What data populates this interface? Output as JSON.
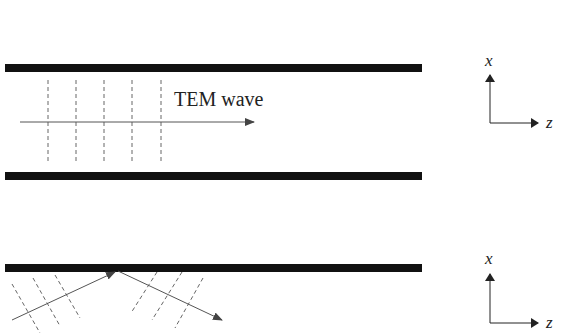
{
  "diagram": {
    "top_panel": {
      "label": "TEM wave",
      "axes": {
        "vertical": "x",
        "horizontal": "z"
      }
    },
    "bottom_panel": {
      "axes": {
        "vertical": "x",
        "horizontal": "z"
      }
    },
    "colors": {
      "plate": "#111111",
      "arrow": "#555555",
      "wavefront": "#666666",
      "text": "#222222"
    }
  }
}
